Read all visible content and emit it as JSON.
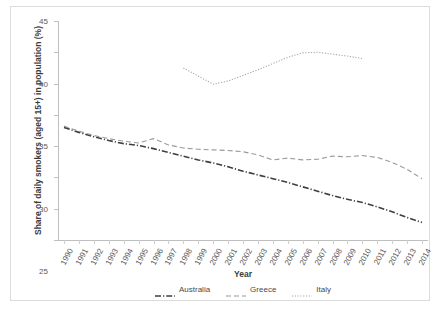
{
  "chart_data": {
    "type": "line",
    "title": "",
    "xlabel": "Year",
    "ylabel": "Share of daily smokers (aged 15+) in population (%)",
    "ylim": [
      10,
      45
    ],
    "yticks": [
      10,
      15,
      20,
      25,
      30,
      35,
      40,
      45
    ],
    "grid": false,
    "legend_position": "bottom",
    "x": [
      1990,
      1991,
      1992,
      1993,
      1994,
      1995,
      1996,
      1997,
      1998,
      1999,
      2000,
      2001,
      2002,
      2003,
      2004,
      2005,
      2006,
      2007,
      2008,
      2009,
      2010,
      2011,
      2012,
      2013,
      2014
    ],
    "categories": [
      "1990",
      "1991",
      "1992",
      "1993",
      "1994",
      "1995",
      "1996",
      "1997",
      "1998",
      "1999",
      "2000",
      "2001",
      "2002",
      "2003",
      "2004",
      "2005",
      "2006",
      "2007",
      "2008",
      "2009",
      "2010",
      "2011",
      "2012",
      "2013",
      "2014"
    ],
    "series": [
      {
        "name": "Australia",
        "style": "dash-dot",
        "color": "#3f3f3f",
        "x": [
          1990,
          1991,
          1992,
          1993,
          1994,
          1995,
          1996,
          1997,
          1998,
          1999,
          2000,
          2001,
          2002,
          2003,
          2004,
          2005,
          2006,
          2007,
          2008,
          2009,
          2010,
          2011,
          2012,
          2013,
          2014
        ],
        "values": [
          28.0,
          27.2,
          26.5,
          25.9,
          25.4,
          25.1,
          24.6,
          24.0,
          23.4,
          22.8,
          22.3,
          21.7,
          21.0,
          20.4,
          19.8,
          19.2,
          18.5,
          17.8,
          17.1,
          16.5,
          16.0,
          15.3,
          14.5,
          13.6,
          12.8
        ]
      },
      {
        "name": "Greece",
        "style": "dashed",
        "color": "#9a9a9a",
        "x": [
          1990,
          1991,
          1992,
          1993,
          1994,
          1995,
          1996,
          1997,
          1998,
          1999,
          2000,
          2001,
          2002,
          2003,
          2004,
          2005,
          2006,
          2007,
          2008,
          2009,
          2010,
          2011,
          2012,
          2013,
          2014
        ],
        "values": [
          28.2,
          27.4,
          26.7,
          26.2,
          25.8,
          25.5,
          26.2,
          25.2,
          24.7,
          24.5,
          24.4,
          24.3,
          24.1,
          23.6,
          22.8,
          23.1,
          22.8,
          22.9,
          23.4,
          23.3,
          23.5,
          23.2,
          22.4,
          21.3,
          19.8
        ]
      },
      {
        "name": "Italy",
        "style": "dotted",
        "color": "#a8a8a8",
        "x": [
          1998,
          1999,
          2000,
          2001,
          2002,
          2003,
          2004,
          2005,
          2006,
          2007,
          2008,
          2009,
          2010
        ],
        "values": [
          37.5,
          36.2,
          34.9,
          35.4,
          36.3,
          37.2,
          38.2,
          39.2,
          39.9,
          40.0,
          39.7,
          39.4,
          39.0
        ]
      }
    ],
    "legend": [
      "Australia",
      "Greece",
      "Italy"
    ]
  },
  "legend": {
    "items": [
      {
        "label": "Australia",
        "swatch": "dash-dot-swatch"
      },
      {
        "label": "Greece",
        "swatch": "dashed-swatch"
      },
      {
        "label": "Italy",
        "swatch": "dotted-swatch"
      }
    ]
  },
  "axes": {
    "x_title": "Year",
    "y_title": "Share of daily smokers (aged 15+) in population (%)"
  },
  "colors": {
    "border": "#dcdcdc",
    "axis": "#bfbfbf",
    "text": "#5a5a5a",
    "australia": "#3f3f3f",
    "greece": "#9a9a9a",
    "italy": "#a8a8a8"
  }
}
